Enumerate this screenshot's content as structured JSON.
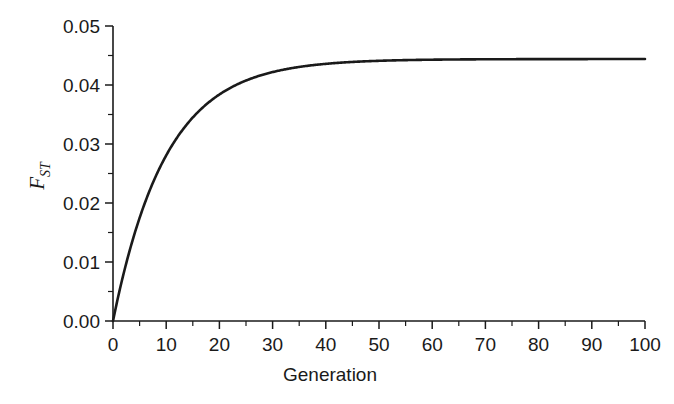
{
  "chart_data": {
    "type": "line",
    "title": "",
    "xlabel": "Generation",
    "ylabel": "F_ST",
    "ylabel_main": "F",
    "ylabel_sub": "ST",
    "xlim": [
      0,
      100
    ],
    "ylim": [
      0.0,
      0.05
    ],
    "grid": false,
    "legend": "none",
    "xticks": [
      0,
      10,
      20,
      30,
      40,
      50,
      60,
      70,
      80,
      90,
      100
    ],
    "xtick_labels": [
      "0",
      "10",
      "20",
      "30",
      "40",
      "50",
      "60",
      "70",
      "80",
      "90",
      "100"
    ],
    "xminor_ticks": [
      5,
      15,
      25,
      35,
      45,
      55,
      65,
      75,
      85,
      95
    ],
    "yticks": [
      0.0,
      0.01,
      0.02,
      0.03,
      0.04,
      0.05
    ],
    "ytick_labels": [
      "0.00",
      "0.01",
      "0.02",
      "0.03",
      "0.04",
      "0.05"
    ],
    "yminor_ticks": [
      0.005,
      0.015,
      0.025,
      0.035,
      0.045
    ],
    "asymptote": 0.0444,
    "rate": 0.1,
    "line_color": "#1a1a1a",
    "series": [
      {
        "name": "F_ST",
        "x": [
          0,
          1,
          2,
          3,
          4,
          5,
          6,
          7,
          8,
          9,
          10,
          12,
          14,
          16,
          18,
          20,
          22,
          25,
          28,
          30,
          35,
          40,
          45,
          50,
          60,
          70,
          80,
          90,
          100
        ],
        "values": [
          0.0,
          0.00423,
          0.00805,
          0.01151,
          0.01463,
          0.01747,
          0.02003,
          0.02235,
          0.02445,
          0.02635,
          0.02807,
          0.03104,
          0.03347,
          0.03545,
          0.03707,
          0.03839,
          0.03947,
          0.04075,
          0.0417,
          0.04219,
          0.04306,
          0.04359,
          0.04391,
          0.0441,
          0.0443,
          0.04436,
          0.04439,
          0.0444,
          0.0444
        ]
      }
    ]
  },
  "figure": {
    "background_color": "#ffffff",
    "axis_color": "#1a1a1a"
  }
}
